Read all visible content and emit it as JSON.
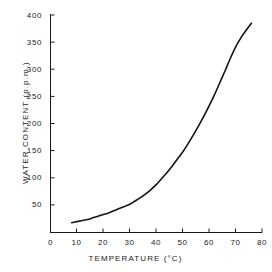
{
  "chart_data": {
    "type": "line",
    "title": "",
    "xlabel": "TEMPERATURE  (°C)",
    "ylabel": "WATER CONTENT (p.p.m.)",
    "xlim": [
      0,
      80
    ],
    "ylim": [
      0,
      400
    ],
    "xticks": [
      0,
      10,
      20,
      30,
      40,
      50,
      60,
      70,
      80
    ],
    "xtick_labels": [
      "0",
      "10",
      "20",
      "30",
      "40",
      "50",
      "60",
      "70",
      "80"
    ],
    "yticks": [
      0,
      50,
      100,
      150,
      200,
      250,
      300,
      350,
      400
    ],
    "ytick_labels": [
      "0",
      "50",
      "100",
      "150",
      "200",
      "250",
      "300",
      "350",
      "400"
    ],
    "grid": false,
    "legend": false,
    "line_color": "#141414",
    "line_width": 1.6,
    "series": [
      {
        "name": "water content vs temperature",
        "x": [
          8,
          10,
          12,
          14,
          16,
          18,
          20,
          22,
          24,
          26,
          28,
          30,
          32,
          34,
          36,
          38,
          40,
          42,
          44,
          46,
          48,
          50,
          52,
          54,
          56,
          58,
          60,
          62,
          64,
          66,
          68,
          70,
          72,
          74,
          76
        ],
        "y": [
          18,
          20,
          22,
          24,
          27,
          30,
          33,
          36,
          40,
          44,
          48,
          52,
          58,
          64,
          71,
          79,
          88,
          99,
          110,
          122,
          135,
          148,
          163,
          179,
          196,
          214,
          233,
          253,
          275,
          297,
          320,
          341,
          358,
          372,
          385
        ]
      }
    ]
  },
  "axes": {
    "x_axis_name": "temperature-axis",
    "y_axis_name": "water-content-axis"
  }
}
